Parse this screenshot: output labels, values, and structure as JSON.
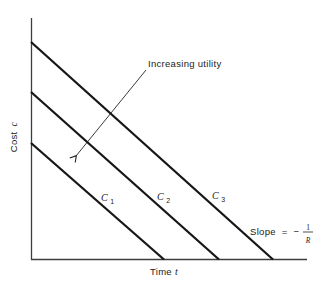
{
  "figure": {
    "background": "#ffffff",
    "line_color": "#161616",
    "axis_color": "#3d3d3d",
    "text_color": "#222222",
    "axes": {
      "y_label_word": "Cost",
      "y_label_var": "c",
      "x_label_word": "Time",
      "x_label_var": "t"
    },
    "annotation": {
      "text": "Increasing utility"
    },
    "lines": [
      {
        "base": "C",
        "sub": "1"
      },
      {
        "base": "C",
        "sub": "2"
      },
      {
        "base": "C",
        "sub": "3"
      }
    ],
    "slope": {
      "prefix": "Slope",
      "equals": "=",
      "minus": "−",
      "numerator": "1",
      "denominator": "R"
    }
  }
}
